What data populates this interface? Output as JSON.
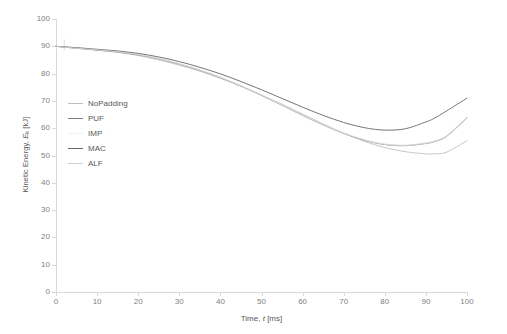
{
  "chart_data": {
    "type": "line",
    "title": "",
    "xlabel": "Time, t [ms]",
    "ylabel": "Kinetic Energy, E_k [kJ]",
    "xlabel_parts": {
      "pre": "Time, ",
      "italic": "t",
      "post": " [ms]"
    },
    "ylabel_parts": {
      "pre": "Kinetic Energy, ",
      "italic": "E",
      "sub": "k",
      "post": " [kJ]"
    },
    "xlim": [
      0,
      100
    ],
    "ylim": [
      0,
      100
    ],
    "xticks": [
      0,
      10,
      20,
      30,
      40,
      50,
      60,
      70,
      80,
      90,
      100
    ],
    "yticks": [
      0,
      10,
      20,
      30,
      40,
      50,
      60,
      70,
      80,
      90,
      100
    ],
    "grid": false,
    "legend_position": "inside-left",
    "x": [
      0,
      2,
      5,
      10,
      15,
      20,
      25,
      30,
      35,
      40,
      45,
      50,
      55,
      60,
      65,
      70,
      75,
      80,
      85,
      90,
      92,
      95,
      100
    ],
    "series": [
      {
        "name": "NoPadding",
        "color": "#bfbfbf",
        "values": [
          90.0,
          89.7,
          89.3,
          88.6,
          87.8,
          86.6,
          85.0,
          83.1,
          80.9,
          78.3,
          75.4,
          72.2,
          68.8,
          65.2,
          61.6,
          58.2,
          55.2,
          52.9,
          51.4,
          50.6,
          50.6,
          51.2,
          55.4
        ]
      },
      {
        "name": "PUF",
        "color": "#7f7f7f",
        "values": [
          90.0,
          89.7,
          89.3,
          88.6,
          87.9,
          86.9,
          85.4,
          83.5,
          81.2,
          78.5,
          75.4,
          72.0,
          68.4,
          64.7,
          61.2,
          58.1,
          55.6,
          54.0,
          53.6,
          54.4,
          55.1,
          57.0,
          63.8
        ]
      },
      {
        "name": "IMP",
        "color": "#e8e8e8",
        "values": [
          90.0,
          89.7,
          89.4,
          88.8,
          88.1,
          87.1,
          85.6,
          83.7,
          81.4,
          78.7,
          75.6,
          72.2,
          68.6,
          64.9,
          61.4,
          58.3,
          55.8,
          54.2,
          53.8,
          54.6,
          55.3,
          57.2,
          64.0
        ]
      },
      {
        "name": "MAC",
        "color": "#666666",
        "values": [
          90.0,
          89.8,
          89.5,
          88.9,
          88.3,
          87.4,
          86.1,
          84.4,
          82.3,
          79.9,
          77.1,
          74.1,
          70.9,
          67.7,
          64.7,
          62.1,
          60.2,
          59.3,
          59.8,
          62.3,
          63.6,
          66.3,
          71.0
        ]
      },
      {
        "name": "ALF",
        "color": "#d0d0d0",
        "values": [
          90.0,
          89.7,
          89.3,
          88.7,
          88.0,
          87.0,
          85.5,
          83.6,
          81.3,
          78.6,
          75.5,
          72.1,
          68.5,
          64.8,
          61.3,
          58.2,
          55.7,
          54.1,
          53.7,
          54.5,
          55.2,
          57.1,
          63.9
        ]
      }
    ],
    "start_marker": {
      "x": 2,
      "y_top": 92.5,
      "y_bottom": 88.5,
      "color": "#d9d9d9"
    }
  },
  "legend": {
    "items": [
      {
        "label": "NoPadding",
        "color": "#bfbfbf"
      },
      {
        "label": "PUF",
        "color": "#7f7f7f"
      },
      {
        "label": "IMP",
        "color": "#f2f2f2"
      },
      {
        "label": "MAC",
        "color": "#666666"
      },
      {
        "label": "ALF",
        "color": "#d0d0d0"
      }
    ]
  },
  "axis_style": {
    "line_color": "#d9d9d9",
    "tick_label_color": "#7f7f7f",
    "title_color": "#595959"
  }
}
